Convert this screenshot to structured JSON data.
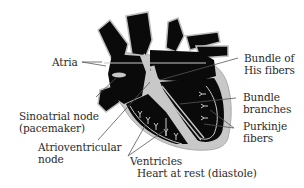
{
  "diagram": {
    "title": "Heart at rest (diastole)",
    "colors": {
      "muscle": "#0a0a0a",
      "conduction": "#c8c8c8",
      "outline": "#bdbdbd",
      "leader": "#555555",
      "text": "#2a2a2a",
      "background": "#ffffff"
    },
    "labels": {
      "atria": "Atria",
      "sa_node_line1": "Sinoatrial node",
      "sa_node_line2": "(pacemaker)",
      "av_node_line1": "Atrioventricular",
      "av_node_line2": "node",
      "ventricles": "Ventricles",
      "bundle_his_line1": "Bundle of",
      "bundle_his_line2": "His fibers",
      "bundle_branches_line1": "Bundle",
      "bundle_branches_line2": "branches",
      "purkinje_line1": "Purkinje",
      "purkinje_line2": "fibers",
      "caption": "Heart at rest (diastole)"
    }
  }
}
